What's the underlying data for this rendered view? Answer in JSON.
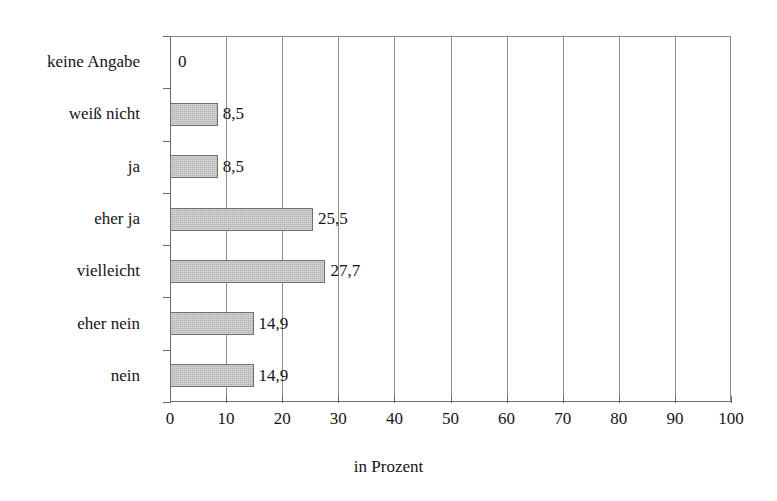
{
  "chart_data": {
    "type": "bar",
    "orientation": "horizontal",
    "title": "",
    "subtitle": "",
    "xlabel": "in Prozent",
    "ylabel": "",
    "categories": [
      "keine Angabe",
      "weiß nicht",
      "ja",
      "eher ja",
      "vielleicht",
      "eher nein",
      "nein"
    ],
    "values": [
      0,
      8.5,
      8.5,
      25.5,
      27.7,
      14.9,
      14.9
    ],
    "value_labels": [
      "0",
      "8,5",
      "8,5",
      "25,5",
      "27,7",
      "14,9",
      "14,9"
    ],
    "xlim": [
      0,
      100
    ],
    "xticks": [
      0,
      10,
      20,
      30,
      40,
      50,
      60,
      70,
      80,
      90,
      100
    ],
    "xtick_labels": [
      "0",
      "10",
      "20",
      "30",
      "40",
      "50",
      "60",
      "70",
      "80",
      "90",
      "100"
    ],
    "grid": "vertical",
    "legend": "none",
    "bar_color": "#b3b3b3",
    "bar_border_color": "#707070",
    "axis_color": "#6b6b6b",
    "grid_color": "#8f8f8f",
    "text_color": "#141414",
    "background": "#ffffff"
  }
}
